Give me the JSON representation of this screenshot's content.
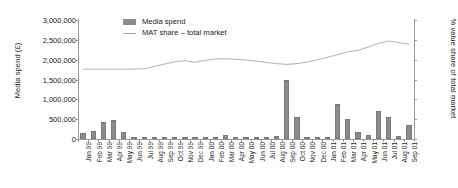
{
  "chart_data": {
    "type": "bar",
    "title": "",
    "xlabel": "",
    "ylabel": "Media spend (£)",
    "y2label": "% value share of total market",
    "ylim": [
      0,
      3000000
    ],
    "grid": false,
    "legend_position": "top-left-inside",
    "categories": [
      "Jan 99",
      "Feb 99",
      "Mar 99",
      "Apr 99",
      "May 99",
      "Jun 99",
      "Jul 99",
      "Aug 99",
      "Sep 99",
      "Oct 99",
      "Nov 99",
      "Dec 99",
      "Jan 00",
      "Feb 00",
      "Mar 00",
      "Apr 00",
      "May 00",
      "Jun 00",
      "Jul 00",
      "Aug 00",
      "Sep 00",
      "Oct 00",
      "Nov 00",
      "Dec 00",
      "Jan 01",
      "Feb 01",
      "Mar 01",
      "Apr 01",
      "May 01",
      "Jun 01",
      "Jul 01",
      "Aug 01",
      "Sep 01"
    ],
    "y_ticks": [
      "0",
      "500,000",
      "1,000,000",
      "1,500,000",
      "2,000,000",
      "2,500,000",
      "3,000,000"
    ],
    "y_tick_values": [
      0,
      500000,
      1000000,
      1500000,
      2000000,
      2500000,
      3000000
    ],
    "series": [
      {
        "name": "Media spend",
        "type": "bar",
        "color": "#8c8c8c",
        "axis": "left",
        "values": [
          150000,
          205000,
          420000,
          470000,
          185000,
          40000,
          25000,
          55000,
          60000,
          45000,
          35000,
          30000,
          45000,
          60000,
          95000,
          60000,
          50000,
          45000,
          55000,
          80000,
          1480000,
          565000,
          20000,
          30000,
          45000,
          875000,
          500000,
          185000,
          110000,
          715000,
          560000,
          65000,
          345000
        ]
      },
      {
        "name": "MAT share – total market",
        "type": "line",
        "color": "#a8a8a8",
        "axis": "right",
        "values_as_left_scale": [
          1760000,
          1760000,
          1760000,
          1760000,
          1760000,
          1765000,
          1770000,
          1830000,
          1890000,
          1945000,
          1975000,
          1935000,
          1985000,
          2020000,
          2020000,
          2010000,
          1990000,
          1965000,
          1930000,
          1900000,
          1880000,
          1900000,
          1940000,
          1995000,
          2060000,
          2130000,
          2200000,
          2235000,
          2320000,
          2410000,
          2470000,
          2430000,
          2390000
        ]
      }
    ]
  },
  "legend": {
    "items": [
      {
        "label": "Media spend",
        "marker": "bar-swatch"
      },
      {
        "label": "MAT share – total market",
        "marker": "line-swatch"
      }
    ]
  }
}
